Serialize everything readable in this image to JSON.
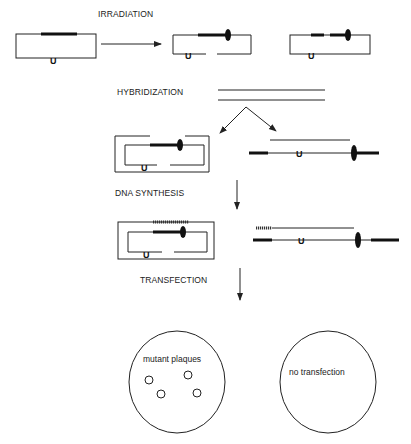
{
  "steps": {
    "irradiation": "IRRADIATION",
    "hybridization": "HYBRIDIZATION",
    "dna_synthesis": "DNA SYNTHESIS",
    "transfection": "TRANSFECTION"
  },
  "markers": {
    "uracil": "U"
  },
  "plates": {
    "left_label": "mutant plaques",
    "right_label": "no transfection",
    "left_plaque_count": 4
  },
  "colors": {
    "ink": "#222222",
    "background": "#ffffff"
  }
}
